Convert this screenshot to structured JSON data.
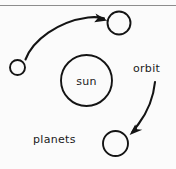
{
  "figure": {
    "type": "hand-drawn-diagram",
    "background_color": "#fbfbfb",
    "ink_color": "#141414",
    "rule_color": "#8d8d8d"
  },
  "labels": {
    "sun": "sun",
    "orbit": "orbit",
    "planets": "planets"
  },
  "bodies": [
    {
      "name": "sun",
      "cx": 86.5,
      "cy": 80.5,
      "r": 25.5,
      "label": "sun"
    },
    {
      "name": "planet-top-right",
      "cx": 119,
      "cy": 23,
      "r": 11.5,
      "label": ""
    },
    {
      "name": "planet-left",
      "cx": 17.5,
      "cy": 67.5,
      "r": 7.5,
      "label": ""
    },
    {
      "name": "planet-bottom-right",
      "cx": 115.5,
      "cy": 143.5,
      "r": 12.5,
      "label": ""
    }
  ],
  "arrows": [
    {
      "name": "orbit-arrow-upper-left",
      "from": [
        25,
        59
      ],
      "to": [
        107,
        20
      ]
    },
    {
      "name": "orbit-arrow-right",
      "from": [
        155,
        82
      ],
      "to": [
        130,
        136
      ]
    }
  ]
}
